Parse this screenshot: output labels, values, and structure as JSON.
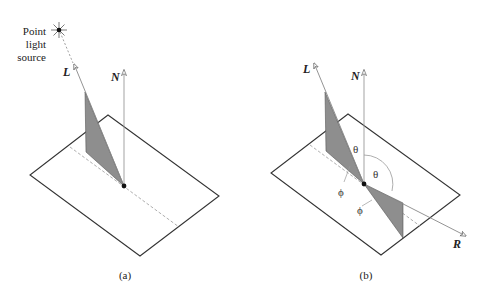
{
  "figure": {
    "panel_a": {
      "caption": "(a)",
      "light_source_label_lines": [
        "Point",
        "light",
        "source"
      ],
      "vector_L": "L",
      "vector_N": "N"
    },
    "panel_b": {
      "caption": "(b)",
      "vector_L": "L",
      "vector_N": "N",
      "vector_R": "R",
      "angle_theta_1": "θ",
      "angle_theta_2": "θ",
      "angle_phi_1": "ϕ",
      "angle_phi_2": "ϕ"
    },
    "colors": {
      "line": "#333333",
      "vector_line": "#888888",
      "dashed": "#999999",
      "shade": "#8e8e8e"
    }
  }
}
